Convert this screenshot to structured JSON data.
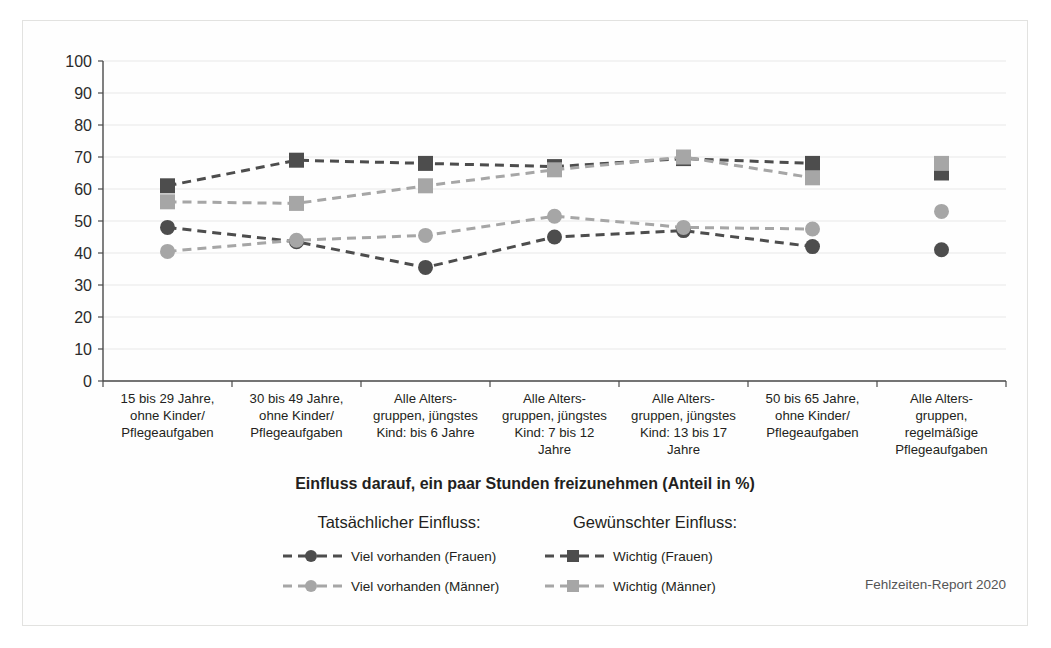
{
  "chart_data": {
    "type": "line",
    "title": "Einfluss darauf, ein paar Stunden freizunehmen (Anteil in %)",
    "xlabel": "",
    "ylabel": "",
    "ylim": [
      0,
      100
    ],
    "yticks": [
      0,
      10,
      20,
      30,
      40,
      50,
      60,
      70,
      80,
      90,
      100
    ],
    "grid": true,
    "legend_position": "bottom",
    "categories": [
      "15 bis 29 Jahre, ohne Kinder/ Pflegeaufgaben",
      "30 bis 49 Jahre, ohne Kinder/ Pflegeaufgaben",
      "Alle Altersgruppen, jüngstes Kind: bis 6 Jahre",
      "Alle Altersgruppen, jüngstes Kind: 7 bis 12 Jahre",
      "Alle Altersgruppen, jüngstes Kind: 13 bis 17 Jahre",
      "50 bis 65 Jahre, ohne Kinder/ Pflegeaufgaben",
      "Alle Altersgruppen, regelmäßige Pflegeaufgaben"
    ],
    "category_lines": [
      [
        "15 bis 29 Jahre,",
        "ohne Kinder/",
        "Pflegeaufgaben"
      ],
      [
        "30 bis 49 Jahre,",
        "ohne Kinder/",
        "Pflegeaufgaben"
      ],
      [
        "Alle Alters-",
        "gruppen, jüngstes",
        "Kind: bis 6 Jahre"
      ],
      [
        "Alle Alters-",
        "gruppen, jüngstes",
        "Kind: 7 bis 12",
        "Jahre"
      ],
      [
        "Alle Alters-",
        "gruppen, jüngstes",
        "Kind: 13 bis 17",
        "Jahre"
      ],
      [
        "50 bis 65 Jahre,",
        "ohne Kinder/",
        "Pflegeaufgaben"
      ],
      [
        "Alle Alters-",
        "gruppen,",
        "regelmäßige",
        "Pflegeaufgaben"
      ]
    ],
    "series": [
      {
        "name": "Wichtig (Frauen)",
        "group": "Gewünschter Einfluss:",
        "marker": "square",
        "color": "#4d4d4d",
        "values": [
          61,
          69,
          68,
          67,
          69.5,
          68,
          65
        ]
      },
      {
        "name": "Wichtig (Männer)",
        "group": "Gewünschter Einfluss:",
        "marker": "square",
        "color": "#a6a6a6",
        "values": [
          56,
          55.5,
          61,
          66,
          70,
          63.5,
          68
        ]
      },
      {
        "name": "Viel vorhanden (Frauen)",
        "group": "Tatsächlicher Einfluss:",
        "marker": "circle",
        "color": "#4d4d4d",
        "values": [
          48,
          43.5,
          35.5,
          45,
          47,
          42,
          41
        ]
      },
      {
        "name": "Viel vorhanden (Männer)",
        "group": "Tatsächlicher Einfluss:",
        "marker": "circle",
        "color": "#a6a6a6",
        "values": [
          40.5,
          44,
          45.5,
          51.5,
          48,
          47.5,
          53
        ]
      }
    ],
    "last_category_disconnected": true
  },
  "legend": {
    "group_left_title": "Tatsächlicher Einfluss:",
    "group_right_title": "Gewünschter Einfluss:",
    "entries": [
      {
        "label": "Viel vorhanden  (Frauen)",
        "marker": "circle",
        "color": "#4d4d4d"
      },
      {
        "label": "Viel vorhanden (Männer)",
        "marker": "circle",
        "color": "#a6a6a6"
      },
      {
        "label": "Wichtig  (Frauen)",
        "marker": "square",
        "color": "#4d4d4d"
      },
      {
        "label": "Wichtig (Männer)",
        "marker": "square",
        "color": "#a6a6a6"
      }
    ]
  },
  "source": {
    "text": "Fehlzeiten-Report 2020"
  },
  "colors": {
    "dark_series": "#4d4d4d",
    "light_series": "#a6a6a6",
    "grid": "#e8e8e8",
    "axis": "#4a4a4a",
    "text": "#231f20"
  }
}
